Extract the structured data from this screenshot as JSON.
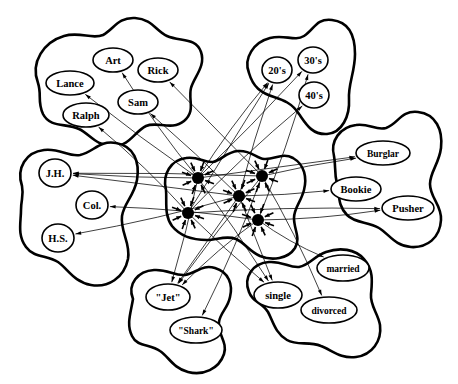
{
  "figure": {
    "colors": {
      "ink": "#000000",
      "paper": "#ffffff",
      "hub": "#000000"
    }
  },
  "pools": [
    {
      "id": "names",
      "name": "name-pool",
      "units": [
        {
          "label": "Art",
          "x": 113,
          "y": 60,
          "rx": 20,
          "ry": 12
        },
        {
          "label": "Rick",
          "x": 158,
          "y": 70,
          "rx": 20,
          "ry": 12
        },
        {
          "label": "Lance",
          "x": 70,
          "y": 83,
          "rx": 24,
          "ry": 12
        },
        {
          "label": "Sam",
          "x": 138,
          "y": 102,
          "rx": 20,
          "ry": 12
        },
        {
          "label": "Ralph",
          "x": 86,
          "y": 115,
          "rx": 23,
          "ry": 12
        }
      ]
    },
    {
      "id": "ages",
      "name": "age-pool",
      "units": [
        {
          "label": "20's",
          "x": 277,
          "y": 70,
          "rx": 15,
          "ry": 13
        },
        {
          "label": "30's",
          "x": 313,
          "y": 60,
          "rx": 15,
          "ry": 13
        },
        {
          "label": "40's",
          "x": 314,
          "y": 95,
          "rx": 15,
          "ry": 13
        }
      ]
    },
    {
      "id": "occupations",
      "name": "occupation-pool",
      "units": [
        {
          "label": "Burglar",
          "x": 383,
          "y": 153,
          "rx": 27,
          "ry": 12
        },
        {
          "label": "Bookie",
          "x": 356,
          "y": 189,
          "rx": 25,
          "ry": 12
        },
        {
          "label": "Pusher",
          "x": 408,
          "y": 208,
          "rx": 26,
          "ry": 12
        }
      ]
    },
    {
      "id": "education",
      "name": "education-pool",
      "units": [
        {
          "label": "J.H.",
          "x": 55,
          "y": 173,
          "rx": 16,
          "ry": 14
        },
        {
          "label": "Col.",
          "x": 92,
          "y": 205,
          "rx": 16,
          "ry": 14
        },
        {
          "label": "H.S.",
          "x": 58,
          "y": 238,
          "rx": 16,
          "ry": 14
        }
      ]
    },
    {
      "id": "gangs",
      "name": "gang-pool",
      "units": [
        {
          "label": "\"Jet\"",
          "x": 168,
          "y": 297,
          "rx": 22,
          "ry": 13
        },
        {
          "label": "\"Shark\"",
          "x": 196,
          "y": 330,
          "rx": 26,
          "ry": 13
        }
      ]
    },
    {
      "id": "marital",
      "name": "marital-status-pool",
      "units": [
        {
          "label": "married",
          "x": 343,
          "y": 268,
          "rx": 26,
          "ry": 13
        },
        {
          "label": "single",
          "x": 278,
          "y": 295,
          "rx": 24,
          "ry": 13
        },
        {
          "label": "divorced",
          "x": 329,
          "y": 310,
          "rx": 28,
          "ry": 13
        }
      ]
    },
    {
      "id": "instances",
      "name": "instance-pool",
      "units": [
        {
          "label": "",
          "x": 198,
          "y": 178,
          "r": 6
        },
        {
          "label": "",
          "x": 262,
          "y": 176,
          "r": 6
        },
        {
          "label": "",
          "x": 239,
          "y": 196,
          "r": 6
        },
        {
          "label": "",
          "x": 188,
          "y": 213,
          "r": 6
        },
        {
          "label": "",
          "x": 258,
          "y": 220,
          "r": 6
        }
      ]
    }
  ],
  "edges": [
    {
      "from": [
        198,
        178
      ],
      "to": [
        113,
        60
      ]
    },
    {
      "from": [
        198,
        178
      ],
      "to": [
        70,
        83
      ]
    },
    {
      "from": [
        262,
        176
      ],
      "to": [
        158,
        70
      ]
    },
    {
      "from": [
        239,
        196
      ],
      "to": [
        138,
        102
      ]
    },
    {
      "from": [
        188,
        213
      ],
      "to": [
        86,
        115
      ]
    },
    {
      "from": [
        198,
        178
      ],
      "to": [
        277,
        70
      ]
    },
    {
      "from": [
        239,
        196
      ],
      "to": [
        277,
        70
      ]
    },
    {
      "from": [
        188,
        213
      ],
      "to": [
        277,
        70
      ]
    },
    {
      "from": [
        198,
        178
      ],
      "to": [
        313,
        60
      ]
    },
    {
      "from": [
        258,
        220
      ],
      "to": [
        313,
        60
      ]
    },
    {
      "from": [
        188,
        213
      ],
      "to": [
        314,
        95
      ]
    },
    {
      "from": [
        262,
        176
      ],
      "to": [
        383,
        153
      ]
    },
    {
      "from": [
        198,
        178
      ],
      "to": [
        383,
        153
      ]
    },
    {
      "from": [
        239,
        196
      ],
      "to": [
        356,
        189
      ]
    },
    {
      "from": [
        258,
        220
      ],
      "to": [
        408,
        208
      ]
    },
    {
      "from": [
        188,
        213
      ],
      "to": [
        408,
        208
      ]
    },
    {
      "from": [
        198,
        178
      ],
      "to": [
        55,
        173
      ]
    },
    {
      "from": [
        239,
        196
      ],
      "to": [
        55,
        173
      ]
    },
    {
      "from": [
        262,
        176
      ],
      "to": [
        55,
        173
      ]
    },
    {
      "from": [
        258,
        220
      ],
      "to": [
        92,
        205
      ]
    },
    {
      "from": [
        239,
        196
      ],
      "to": [
        58,
        238
      ]
    },
    {
      "from": [
        198,
        178
      ],
      "to": [
        168,
        297
      ]
    },
    {
      "from": [
        239,
        196
      ],
      "to": [
        168,
        297
      ]
    },
    {
      "from": [
        262,
        176
      ],
      "to": [
        168,
        297
      ]
    },
    {
      "from": [
        258,
        220
      ],
      "to": [
        168,
        297
      ]
    },
    {
      "from": [
        262,
        176
      ],
      "to": [
        196,
        330
      ]
    },
    {
      "from": [
        198,
        178
      ],
      "to": [
        278,
        295
      ]
    },
    {
      "from": [
        239,
        196
      ],
      "to": [
        278,
        295
      ]
    },
    {
      "from": [
        188,
        213
      ],
      "to": [
        278,
        295
      ]
    },
    {
      "from": [
        258,
        220
      ],
      "to": [
        343,
        268
      ]
    },
    {
      "from": [
        262,
        176
      ],
      "to": [
        329,
        310
      ]
    }
  ]
}
